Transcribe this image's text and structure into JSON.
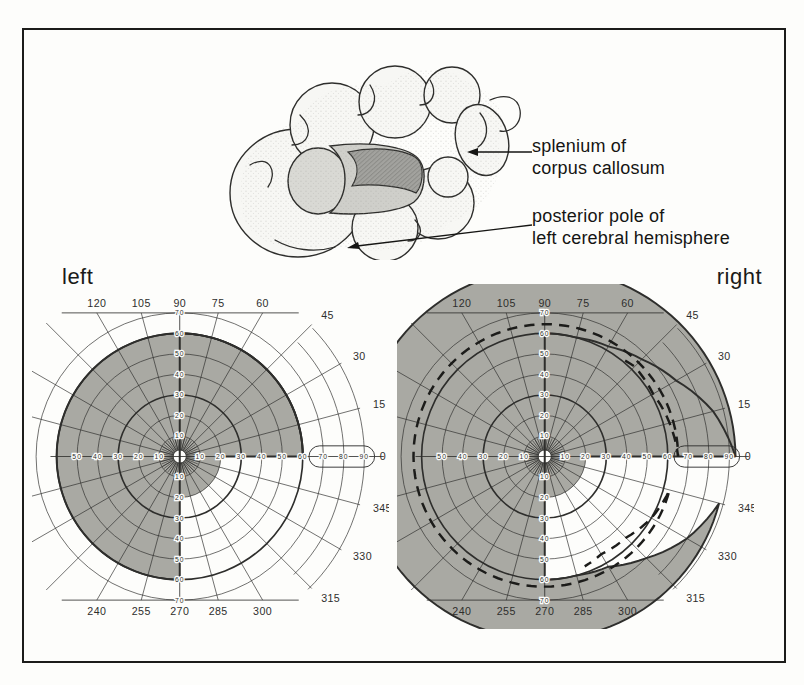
{
  "annotations": {
    "splenium": {
      "line1": "splenium of",
      "line2": "corpus callosum"
    },
    "posterior_pole": {
      "line1": "posterior pole of",
      "line2": "left cerebral hemisphere"
    }
  },
  "colors": {
    "defect_light": "#dbdbd6",
    "defect_dark": "#a9a9a3",
    "line": "#2e2e2c",
    "frame": "#1c1c1a",
    "background": "#fdfdfb"
  },
  "chart_data": {
    "type": "polar_perimetry_pair",
    "grid": {
      "circles": [
        10,
        20,
        30,
        40,
        50,
        60,
        70
      ],
      "bold_circles": [
        30,
        60
      ],
      "outer_arcs": [
        80,
        90
      ],
      "meridian_step": 15,
      "top_bottom_clip": 70,
      "blind_spot_box": {
        "from": 63,
        "to": 95,
        "half_height": 5.2
      }
    },
    "meridian_labels": [
      {
        "a": 0,
        "t": "0"
      },
      {
        "a": 15,
        "t": "15"
      },
      {
        "a": 30,
        "t": "30"
      },
      {
        "a": 45,
        "t": "45"
      },
      {
        "a": 60,
        "t": "60"
      },
      {
        "a": 75,
        "t": "75"
      },
      {
        "a": 90,
        "t": "90"
      },
      {
        "a": 105,
        "t": "105"
      },
      {
        "a": 120,
        "t": "120"
      },
      {
        "a": 240,
        "t": "240"
      },
      {
        "a": 255,
        "t": "255"
      },
      {
        "a": 270,
        "t": "270"
      },
      {
        "a": 285,
        "t": "285"
      },
      {
        "a": 300,
        "t": "300"
      },
      {
        "a": 315,
        "t": "315"
      },
      {
        "a": 330,
        "t": "330"
      },
      {
        "a": 345,
        "t": "345"
      }
    ],
    "eccentricity_labels": {
      "horizontal_left": [
        {
          "r": 50,
          "t": "50"
        },
        {
          "r": 40,
          "t": "40"
        },
        {
          "r": 30,
          "t": "30"
        },
        {
          "r": 20,
          "t": "20"
        },
        {
          "r": 10,
          "t": "10"
        }
      ],
      "horizontal_right": [
        {
          "r": 10,
          "t": "10"
        },
        {
          "r": 20,
          "t": "20"
        },
        {
          "r": 30,
          "t": "30"
        },
        {
          "r": 40,
          "t": "40"
        },
        {
          "r": 50,
          "t": "50"
        },
        {
          "r": 60,
          "t": "60"
        }
      ],
      "blind_spot_box": [
        {
          "r": 70,
          "t": "70"
        },
        {
          "r": 80,
          "t": "80"
        },
        {
          "r": 90,
          "t": "90"
        }
      ],
      "vertical_upper": [
        {
          "r": 70,
          "t": "70"
        },
        {
          "r": 60,
          "t": "60"
        },
        {
          "r": 50,
          "t": "50"
        },
        {
          "r": 40,
          "t": "40"
        },
        {
          "r": 30,
          "t": "30"
        },
        {
          "r": 20,
          "t": "20"
        },
        {
          "r": 10,
          "t": "10"
        }
      ],
      "vertical_lower": [
        {
          "r": 10,
          "t": "10"
        },
        {
          "r": 20,
          "t": "20"
        },
        {
          "r": 30,
          "t": "30"
        },
        {
          "r": 40,
          "t": "40"
        },
        {
          "r": 50,
          "t": "50"
        },
        {
          "r": 60,
          "t": "60"
        },
        {
          "r": 70,
          "t": "70"
        }
      ]
    },
    "charts": [
      {
        "title": "left",
        "light_outer": [
          [
            90,
            60
          ],
          [
            0,
            60
          ]
        ],
        "dark_outer": [
          [
            0,
            60
          ],
          [
            270,
            60
          ]
        ],
        "inner_radius": 20,
        "dashed": null
      },
      {
        "title": "right",
        "light_outer": [
          [
            90,
            60
          ],
          [
            75,
            60
          ],
          [
            60,
            62
          ],
          [
            45,
            67
          ],
          [
            30,
            74
          ],
          [
            15,
            85
          ],
          [
            0,
            93
          ]
        ],
        "dark_outer": [
          [
            0,
            93
          ],
          [
            345,
            88
          ],
          [
            330,
            80
          ],
          [
            315,
            70
          ],
          [
            300,
            62
          ],
          [
            285,
            60
          ],
          [
            270,
            60
          ]
        ],
        "inner_radius": 20,
        "dashed": [
          [
            50,
            61
          ],
          [
            45,
            62
          ],
          [
            30,
            61
          ],
          [
            15,
            63
          ],
          [
            0,
            65
          ],
          [
            345,
            63
          ],
          [
            330,
            60
          ],
          [
            315,
            56
          ],
          [
            300,
            55
          ],
          [
            290,
            57
          ]
        ]
      }
    ]
  }
}
